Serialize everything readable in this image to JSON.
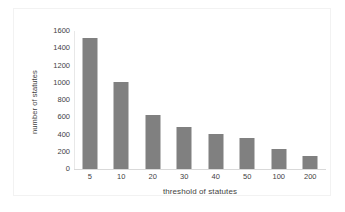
{
  "chart_data": {
    "type": "bar",
    "title": "",
    "subtitle": "",
    "categories": [
      "5",
      "10",
      "20",
      "30",
      "40",
      "50",
      "100",
      "200"
    ],
    "values": [
      1520,
      1010,
      630,
      490,
      410,
      360,
      235,
      150
    ],
    "xlabel": "threshold of statutes",
    "ylabel": "number of statutes",
    "ylim": [
      0,
      1600
    ],
    "yticks": [
      "1600",
      "1400",
      "1200",
      "1000",
      "800",
      "600",
      "400",
      "200",
      "0"
    ],
    "ytick_values": [
      1600,
      1400,
      1200,
      1000,
      800,
      600,
      400,
      200,
      0
    ],
    "grid": false,
    "legend": "none",
    "bar_color": "#808080",
    "text_color": "#3f3f3f",
    "frame_color": "#f2f2f2",
    "axis_color": "#d9d9d9",
    "background": "#ffffff"
  }
}
